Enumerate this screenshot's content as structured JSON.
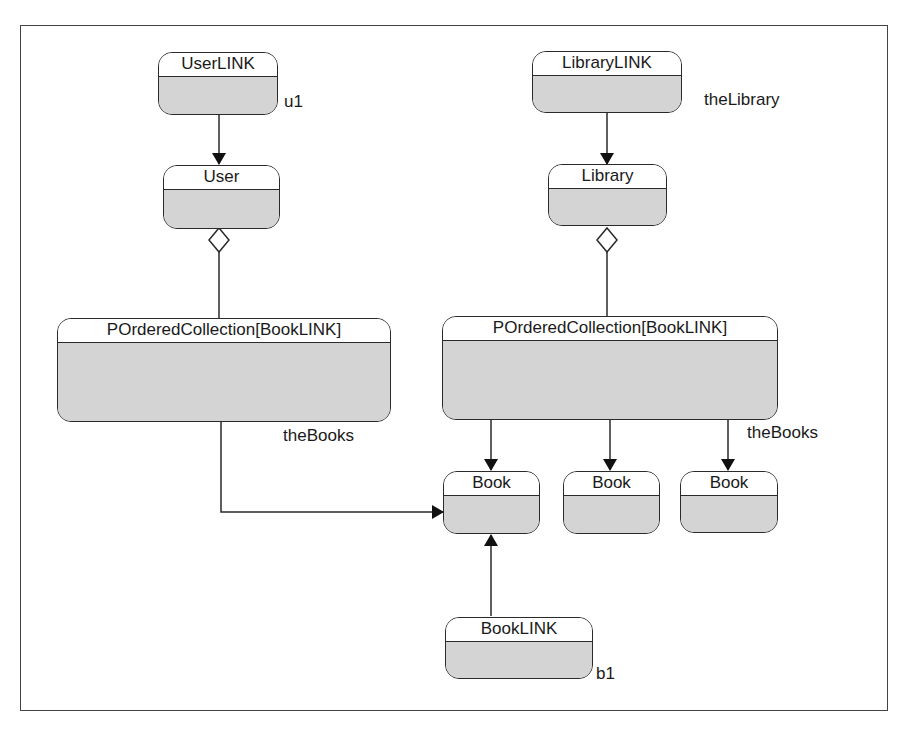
{
  "diagram": {
    "type": "object-instance-diagram",
    "nodes": [
      {
        "id": "userlink",
        "title": "UserLINK",
        "instance_label": "u1"
      },
      {
        "id": "user",
        "title": "User"
      },
      {
        "id": "user_collection",
        "title": "POrderedCollection[BookLINK]",
        "instance_label": "theBooks"
      },
      {
        "id": "librarylink",
        "title": "LibraryLINK",
        "instance_label": "theLibrary"
      },
      {
        "id": "library",
        "title": "Library"
      },
      {
        "id": "library_collection",
        "title": "POrderedCollection[BookLINK]",
        "instance_label": "theBooks"
      },
      {
        "id": "book1",
        "title": "Book"
      },
      {
        "id": "book2",
        "title": "Book"
      },
      {
        "id": "book3",
        "title": "Book"
      },
      {
        "id": "booklink",
        "title": "BookLINK",
        "instance_label": "b1"
      }
    ],
    "edges": [
      {
        "from": "userlink",
        "to": "user",
        "type": "arrow"
      },
      {
        "from": "user",
        "to": "user_collection",
        "type": "aggregation"
      },
      {
        "from": "user_collection",
        "to": "book1",
        "type": "arrow-elbow"
      },
      {
        "from": "librarylink",
        "to": "library",
        "type": "arrow"
      },
      {
        "from": "library",
        "to": "library_collection",
        "type": "aggregation"
      },
      {
        "from": "library_collection",
        "to": "book1",
        "type": "arrow"
      },
      {
        "from": "library_collection",
        "to": "book2",
        "type": "arrow"
      },
      {
        "from": "library_collection",
        "to": "book3",
        "type": "arrow"
      },
      {
        "from": "booklink",
        "to": "book1",
        "type": "arrow"
      }
    ]
  },
  "nodes": {
    "userlink": {
      "title": "UserLINK",
      "label": "u1"
    },
    "user": {
      "title": "User"
    },
    "user_collection": {
      "title": "POrderedCollection[BookLINK]",
      "label": "theBooks"
    },
    "librarylink": {
      "title": "LibraryLINK",
      "label": "theLibrary"
    },
    "library": {
      "title": "Library"
    },
    "library_collection": {
      "title": "POrderedCollection[BookLINK]",
      "label": "theBooks"
    },
    "book1": {
      "title": "Book"
    },
    "book2": {
      "title": "Book"
    },
    "book3": {
      "title": "Book"
    },
    "booklink": {
      "title": "BookLINK",
      "label": "b1"
    }
  },
  "colors": {
    "frame": "#444444",
    "stroke": "#2a2a2a",
    "fill": "#d4d4d4",
    "title_fill": "#ffffff"
  }
}
